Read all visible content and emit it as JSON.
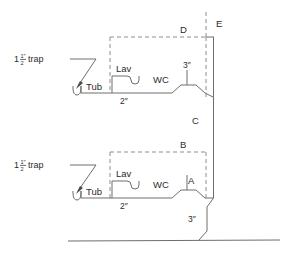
{
  "diagram": {
    "colors": {
      "solid_line": "#6e6e6e",
      "dashed_line": "#8d8d8d",
      "text": "#2b2b2b",
      "background": "#ffffff"
    },
    "trap_label": {
      "whole": "1",
      "numerator": "1″",
      "denominator": "2",
      "text": "trap",
      "full": "1 1/2″ trap"
    },
    "upper_group": {
      "tub_label": "Tub",
      "lav_label": "Lav",
      "wc_label": "WC",
      "branch_size": "2″",
      "wc_size": "3″",
      "box_label": "D",
      "stack_label_top": "E"
    },
    "lower_group": {
      "tub_label": "Tub",
      "lav_label": "Lav",
      "wc_label": "WC",
      "branch_size": "2″",
      "stack_size": "3″",
      "box_label": "B",
      "segment_label": "A",
      "stack_label_above": "C"
    }
  }
}
